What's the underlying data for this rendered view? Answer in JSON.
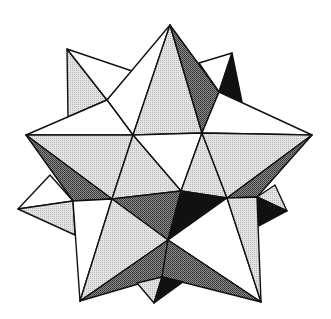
{
  "figure": {
    "width": 331,
    "height": 319,
    "fills": {
      "white": "#ffffff",
      "light": "#d6d6d6",
      "dark": "#6e6e6e",
      "black": "#111111"
    },
    "facets": [
      {
        "name": "back-left-spike-light",
        "fill": "light",
        "points": "67,49 107,100 68,117"
      },
      {
        "name": "back-left-spike-white",
        "fill": "white",
        "points": "67,49 132,71 107,100"
      },
      {
        "name": "back-right-spike-white",
        "fill": "white",
        "points": "199,63 232,53 219,92"
      },
      {
        "name": "back-right-spike-black",
        "fill": "black",
        "points": "232,53 242,102 219,92"
      },
      {
        "name": "top-spike-left-white",
        "fill": "white",
        "points": "170,25 107,100 133,135"
      },
      {
        "name": "top-spike-center-light",
        "fill": "light",
        "points": "170,25 133,135 202,133"
      },
      {
        "name": "top-spike-right-dark",
        "fill": "dark",
        "points": "170,25 202,133 219,92"
      },
      {
        "name": "left-upper-white",
        "fill": "white",
        "points": "26,135 107,100 133,135"
      },
      {
        "name": "right-upper-white",
        "fill": "white",
        "points": "219,92 312,135 202,133"
      },
      {
        "name": "left-arm-light",
        "fill": "light",
        "points": "26,135 133,135 112,199"
      },
      {
        "name": "left-arm-dark",
        "fill": "dark",
        "points": "26,135 112,199 73,201"
      },
      {
        "name": "center-upper-white",
        "fill": "white",
        "points": "133,135 202,133 181,191"
      },
      {
        "name": "center-left-light",
        "fill": "light",
        "points": "133,135 181,191 112,199"
      },
      {
        "name": "center-right-light",
        "fill": "light",
        "points": "202,133 227,198 181,191"
      },
      {
        "name": "right-arm-light",
        "fill": "light",
        "points": "202,133 312,135 227,198"
      },
      {
        "name": "right-arm-dark",
        "fill": "dark",
        "points": "312,135 257,197 227,198"
      },
      {
        "name": "left-side-spike-white",
        "fill": "white",
        "points": "50,175 73,201 18,209"
      },
      {
        "name": "left-side-spike-light",
        "fill": "light",
        "points": "18,209 73,201 75,235"
      },
      {
        "name": "right-side-spike-light",
        "fill": "light",
        "points": "275,185 287,211 257,197"
      },
      {
        "name": "right-side-spike-black",
        "fill": "black",
        "points": "257,197 287,211 257,227"
      },
      {
        "name": "mid-dark",
        "fill": "dark",
        "points": "112,199 181,191 168,240"
      },
      {
        "name": "mid-black",
        "fill": "black",
        "points": "181,191 227,198 168,240"
      },
      {
        "name": "lower-left-white",
        "fill": "white",
        "points": "73,201 112,199 80,301"
      },
      {
        "name": "lower-left-light",
        "fill": "light",
        "points": "112,199 168,240 80,301"
      },
      {
        "name": "lower-right-white",
        "fill": "white",
        "points": "227,198 261,302 168,240"
      },
      {
        "name": "lower-right-light",
        "fill": "light",
        "points": "227,198 257,197 261,302"
      },
      {
        "name": "bottom-left-dark",
        "fill": "dark",
        "points": "80,301 168,240 162,277"
      },
      {
        "name": "bottom-right-dark",
        "fill": "dark",
        "points": "168,240 261,302 162,277"
      },
      {
        "name": "bottom-spike-light",
        "fill": "light",
        "points": "137,283 162,277 154,303"
      },
      {
        "name": "bottom-spike-black",
        "fill": "black",
        "points": "162,277 183,282 154,303"
      }
    ]
  }
}
